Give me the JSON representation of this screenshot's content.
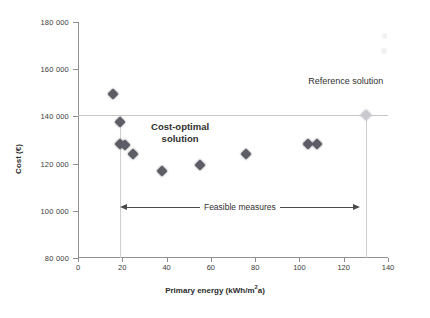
{
  "chart_data": {
    "type": "scatter",
    "title": "",
    "xlabel": "Primary energy (kWh/m²a)",
    "ylabel": "Cost (€)",
    "xlim": [
      0,
      140
    ],
    "ylim": [
      80000,
      180000
    ],
    "xticks": [
      0,
      20,
      40,
      60,
      80,
      100,
      120,
      140
    ],
    "xtick_labels": [
      "0",
      "20",
      "40",
      "60",
      "80",
      "100",
      "120",
      "140"
    ],
    "yticks": [
      80000,
      100000,
      120000,
      140000,
      160000,
      180000
    ],
    "ytick_labels": [
      "80 000",
      "100 000",
      "120 000",
      "140 000",
      "160 000",
      "180 000"
    ],
    "grid": "partial",
    "legend": "none",
    "series": [
      {
        "name": "Solutions",
        "marker": "diamond",
        "color": "#5d5d66",
        "points": [
          {
            "x": 16,
            "y": 149500
          },
          {
            "x": 19,
            "y": 137500
          },
          {
            "x": 19,
            "y": 128500
          },
          {
            "x": 21,
            "y": 128000
          },
          {
            "x": 25,
            "y": 124000
          },
          {
            "x": 38,
            "y": 117000
          },
          {
            "x": 55,
            "y": 119500
          },
          {
            "x": 76,
            "y": 124000
          },
          {
            "x": 104,
            "y": 128500
          },
          {
            "x": 108,
            "y": 128500
          }
        ]
      },
      {
        "name": "Reference solution",
        "marker": "diamond",
        "color": "#c9c9cf",
        "points": [
          {
            "x": 130,
            "y": 140500
          }
        ]
      }
    ],
    "gridlines": {
      "horizontal": [
        140500
      ],
      "vertical": [
        19,
        130
      ]
    },
    "annotations": [
      {
        "name": "cost-optimal",
        "text": "Cost-optimal solution",
        "line1": "Cost-optimal",
        "line2": "solution",
        "x": 33,
        "y": 133000
      },
      {
        "name": "reference",
        "text": "Reference solution",
        "x": 104,
        "y": 154500
      },
      {
        "name": "feasible-range",
        "text": "Feasible measures",
        "x_start": 19,
        "x_end": 130,
        "y": 101500,
        "arrow": "double"
      }
    ]
  },
  "axis_titles": {
    "x": "Primary energy (kWh/m",
    "x_sup": "2",
    "x_tail": "a)",
    "y": "Cost (€)"
  },
  "labels": {
    "cost_optimal_line1": "Cost-optimal",
    "cost_optimal_line2": "solution",
    "reference_solution": "Reference solution",
    "feasible_measures": "Feasible measures"
  },
  "caption": ""
}
